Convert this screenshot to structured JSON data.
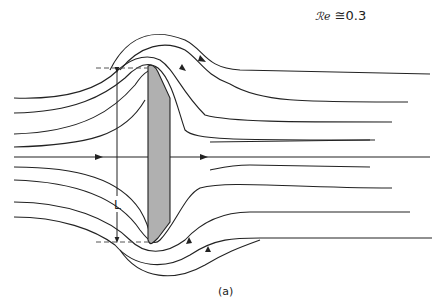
{
  "figure": {
    "reynolds_label_symbol": "ℛ𝑒",
    "reynolds_label_value": "≅0.3",
    "dimension_label": "L",
    "caption": "(a)",
    "colors": {
      "line": "#222222",
      "body_fill": "#b0b0b0",
      "dash": "#555555"
    }
  }
}
